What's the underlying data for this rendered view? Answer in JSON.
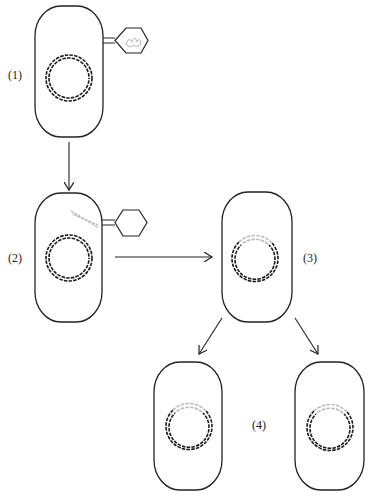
{
  "diagram": {
    "steps": [
      {
        "id": 1,
        "label": "(1)",
        "description": "Phage attaches to bacterial cell; phage DNA inside phage head"
      },
      {
        "id": 2,
        "label": "(2)",
        "description": "Phage DNA injected into bacterial cell"
      },
      {
        "id": 3,
        "label": "(3)",
        "description": "Phage DNA integrated into bacterial chromosome"
      },
      {
        "id": 4,
        "label": "(4)",
        "description": "Cell division; both daughter cells carry integrated phage DNA"
      }
    ],
    "colors": {
      "cell_outline": "#222222",
      "bacterial_dna": "#1a1a1a",
      "phage_dna": "#b8b8b8",
      "background": "#ffffff"
    }
  }
}
